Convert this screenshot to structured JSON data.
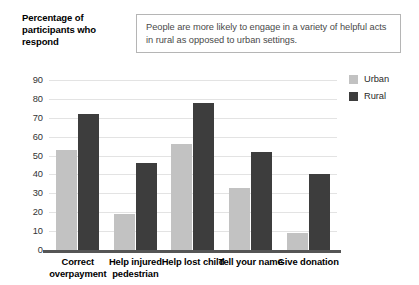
{
  "y_axis_title": "Percentage of participants who respond",
  "caption": "People are more likely to engage in a variety of helpful acts in rural as opposed to urban settings.",
  "legend": {
    "items": [
      {
        "label": "Urban",
        "color": "#c2c2c2"
      },
      {
        "label": "Rural",
        "color": "#3d3d3d"
      }
    ]
  },
  "chart_data": {
    "type": "bar",
    "title": "",
    "xlabel": "",
    "ylabel": "Percentage of participants who respond",
    "ylim": [
      0,
      90
    ],
    "yticks": [
      0,
      10,
      20,
      30,
      40,
      50,
      60,
      70,
      80,
      90
    ],
    "grid": true,
    "legend_position": "right",
    "categories": [
      "Correct overpayment",
      "Help injured pedestrian",
      "Help lost child",
      "Tell your name",
      "Give donation"
    ],
    "series": [
      {
        "name": "Urban",
        "color": "#c2c2c2",
        "values": [
          53,
          19,
          56,
          33,
          9
        ]
      },
      {
        "name": "Rural",
        "color": "#3d3d3d",
        "values": [
          72,
          46,
          78,
          52,
          40
        ]
      }
    ]
  }
}
